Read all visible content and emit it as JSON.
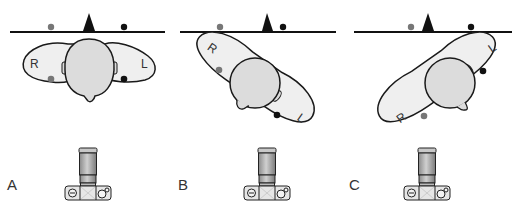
{
  "figure": {
    "panels": [
      {
        "label": "A",
        "orientation": "head facing away, shoulders level",
        "left_side": "R",
        "right_side": "L"
      },
      {
        "label": "B",
        "orientation": "rotated clockwise",
        "left_side": "R",
        "right_side": "L"
      },
      {
        "label": "C",
        "orientation": "rotated counterclockwise",
        "left_side": "R",
        "right_side": "L"
      }
    ],
    "markers": {
      "right_marker_color": "#777777",
      "left_marker_color": "#111111",
      "reference_triangle_color": "#111111"
    },
    "colors": {
      "body_fill": "#efefef",
      "head_fill": "#dcdcdc",
      "outline": "#1a1a1a",
      "camera_lens": "#a8a8a8",
      "camera_body": "#e0e0e0"
    }
  }
}
